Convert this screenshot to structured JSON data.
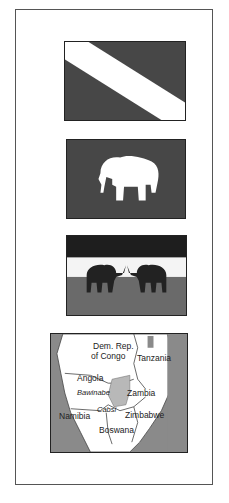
{
  "panel": {
    "flags": [
      {
        "name": "diagonal-stripe-flag",
        "colors": {
          "field": "#474747",
          "stripe": "#ffffff"
        }
      },
      {
        "name": "elephant-flag",
        "colors": {
          "field": "#474747",
          "emblem": "#ffffff"
        }
      },
      {
        "name": "two-elephants-flag",
        "colors": {
          "top_band": "#1e1e1e",
          "middle_band": "#f4f4f4",
          "bottom_band": "#6a6a6a",
          "elephants": "#222222"
        }
      }
    ],
    "map": {
      "labels": {
        "drc_line1": "Dem. Rep.",
        "drc_line2": "of Congo",
        "tanzania": "Tanzania",
        "angola": "Angola",
        "region_italic": "Bawinabe",
        "zambia": "Zambia",
        "namibia": "Namibia",
        "strip_italic": "Cabsi",
        "zimbabwe": "Zimbabwe",
        "botswana": "Boswana"
      },
      "colors": {
        "land": "#ffffff",
        "water": "#8a8a8a",
        "highlight": "#b8b8b8"
      }
    }
  }
}
